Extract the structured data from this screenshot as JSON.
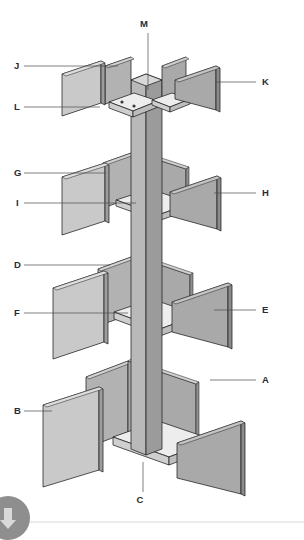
{
  "diagram": {
    "background_color": "#ffffff",
    "colors": {
      "panel_light": "#c9c9c9",
      "panel_mid": "#a9a9a9",
      "panel_dark": "#8f8f8f",
      "shelf_top": "#ededed",
      "shelf_edge": "#c2c2c2",
      "column_light": "#b9b9b9",
      "column_dark": "#9b9b9b",
      "outline": "#1e1e1e",
      "leader_line": "#4a4a4a",
      "label_text": "#2b2b2b",
      "watermark": "#9a9a9a",
      "footer_rule": "#d8d8d8"
    },
    "callouts": [
      {
        "id": "A",
        "label": "A",
        "label_x": 262,
        "label_y": 383,
        "side": "right",
        "leader": "M 210 380 L 256 380",
        "target_x": 210,
        "target_y": 380
      },
      {
        "id": "B",
        "label": "B",
        "label_x": 14,
        "label_y": 414,
        "side": "left",
        "leader": "M 24 411 L 52 411",
        "target_x": 52,
        "target_y": 411
      },
      {
        "id": "C",
        "label": "C",
        "label_x": 140,
        "label_y": 503,
        "side": "bottom",
        "leader": "M 143 462 L 143 492",
        "target_x": 143,
        "target_y": 462
      },
      {
        "id": "D",
        "label": "D",
        "label_x": 14,
        "label_y": 268,
        "side": "left",
        "leader": "M 24 265 L 110 265",
        "target_x": 110,
        "target_y": 265
      },
      {
        "id": "E",
        "label": "E",
        "label_x": 262,
        "label_y": 313,
        "side": "right",
        "leader": "M 214 310 L 256 310",
        "target_x": 214,
        "target_y": 310
      },
      {
        "id": "F",
        "label": "F",
        "label_x": 14,
        "label_y": 316,
        "side": "left",
        "leader": "M 24 313 L 128 313",
        "target_x": 128,
        "target_y": 313
      },
      {
        "id": "G",
        "label": "G",
        "label_x": 14,
        "label_y": 176,
        "side": "left",
        "leader": "M 24 173 L 106 173",
        "target_x": 106,
        "target_y": 173
      },
      {
        "id": "H",
        "label": "H",
        "label_x": 262,
        "label_y": 196,
        "side": "right",
        "leader": "M 214 193 L 256 193",
        "target_x": 214,
        "target_y": 193
      },
      {
        "id": "I",
        "label": "I",
        "label_x": 16,
        "label_y": 206,
        "side": "left",
        "leader": "M 24 203 L 136 203",
        "target_x": 136,
        "target_y": 203
      },
      {
        "id": "J",
        "label": "J",
        "label_x": 14,
        "label_y": 69,
        "side": "left",
        "leader": "M 24 66 L 118 66",
        "target_x": 118,
        "target_y": 66
      },
      {
        "id": "K",
        "label": "K",
        "label_x": 262,
        "label_y": 85,
        "side": "right",
        "leader": "M 216 82 L 256 82",
        "target_x": 216,
        "target_y": 82
      },
      {
        "id": "L",
        "label": "L",
        "label_x": 14,
        "label_y": 110,
        "side": "left",
        "leader": "M 24 107 L 100 107",
        "target_x": 100,
        "target_y": 107
      },
      {
        "id": "M",
        "label": "M",
        "label_x": 144,
        "label_y": 27,
        "side": "top",
        "leader": "M 148 33 L 148 90",
        "target_x": 148,
        "target_y": 90
      }
    ],
    "tiers": [
      {
        "name": "tier-top",
        "items": [
          "M",
          "J",
          "K",
          "L"
        ]
      },
      {
        "name": "tier-second",
        "items": [
          "G",
          "H",
          "I"
        ]
      },
      {
        "name": "tier-third",
        "items": [
          "D",
          "E",
          "F"
        ]
      },
      {
        "name": "tier-bottom",
        "items": [
          "A",
          "B",
          "C"
        ]
      }
    ],
    "footer": {
      "watermark_name": "circular-logo-watermark",
      "rule_present": true
    }
  }
}
